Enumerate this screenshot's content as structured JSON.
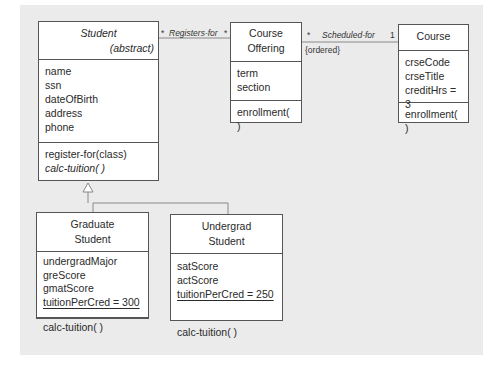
{
  "classes": {
    "student": {
      "name": "Student",
      "stereotype": "(abstract)",
      "attributes": [
        "name",
        "ssn",
        "dateOfBirth",
        "address",
        "phone"
      ],
      "operations": [
        "register-for(class)",
        "calc-tuition( )"
      ]
    },
    "course_offering": {
      "name_line1": "Course",
      "name_line2": "Offering",
      "attributes": [
        "term",
        "section"
      ],
      "operations": [
        "enrollment( )"
      ]
    },
    "course": {
      "name": "Course",
      "attributes": [
        "crseCode",
        "crseTitle",
        "creditHrs = 3"
      ],
      "operations": [
        "enrollment( )"
      ]
    },
    "graduate_student": {
      "name_line1": "Graduate",
      "name_line2": "Student",
      "attributes": [
        "undergradMajor",
        "greScore",
        "gmatScore",
        "tuitionPerCred = 300"
      ],
      "operations": [
        "calc-tuition( )"
      ]
    },
    "undergrad_student": {
      "name_line1": "Undergrad",
      "name_line2": "Student",
      "attributes": [
        "satScore",
        "actScore",
        "tuitionPerCred = 250"
      ],
      "operations": [
        "calc-tuition( )"
      ]
    }
  },
  "associations": {
    "registers_for": {
      "label": "Registers-for",
      "mult_left": "*",
      "mult_right": "*"
    },
    "scheduled_for": {
      "label": "Scheduled-for",
      "mult_left": "*",
      "mult_right": "1",
      "constraint": "{ordered}"
    }
  },
  "colors": {
    "panel": "#ebebeb",
    "border": "#555555",
    "line": "#777777"
  }
}
